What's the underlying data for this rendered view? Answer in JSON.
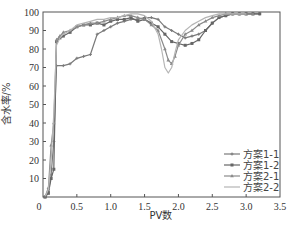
{
  "chart_data": {
    "type": "line",
    "title": "",
    "xlabel": "PV数",
    "ylabel": "含水率/%",
    "xlim": [
      0,
      3.5
    ],
    "ylim": [
      0,
      100
    ],
    "xticks": [
      "0",
      "0.5",
      "1.0",
      "1.5",
      "2.0",
      "2.5",
      "3.0",
      "3.5"
    ],
    "yticks": [
      "0",
      "10",
      "20",
      "30",
      "40",
      "50",
      "60",
      "70",
      "80",
      "90",
      "100"
    ],
    "grid": false,
    "legend_position": "lower right",
    "series": [
      {
        "name": "方案1-1",
        "color": "#7a7a7a",
        "marker": "plus",
        "x": [
          0.03,
          0.08,
          0.12,
          0.16,
          0.2,
          0.3,
          0.4,
          0.5,
          0.6,
          0.7,
          0.8,
          0.9,
          1.0,
          1.1,
          1.2,
          1.3,
          1.4,
          1.5,
          1.6,
          1.7,
          1.8,
          1.9,
          2.0,
          2.1,
          2.2,
          2.3,
          2.4,
          2.5,
          2.6,
          2.7,
          2.8,
          2.9,
          3.0,
          3.1,
          3.2
        ],
        "y": [
          0,
          3,
          12,
          30,
          71,
          71,
          72,
          75,
          76,
          77,
          88,
          90,
          92,
          94,
          95,
          96,
          96,
          97,
          97,
          96,
          92,
          90,
          88,
          86,
          87,
          88,
          90,
          94,
          97,
          98,
          99,
          99,
          99,
          99,
          99
        ]
      },
      {
        "name": "方案1-2",
        "color": "#666666",
        "marker": "square",
        "x": [
          0.03,
          0.08,
          0.12,
          0.16,
          0.2,
          0.25,
          0.3,
          0.4,
          0.5,
          0.6,
          0.7,
          0.8,
          0.9,
          1.0,
          1.1,
          1.2,
          1.3,
          1.4,
          1.5,
          1.6,
          1.7,
          1.8,
          1.9,
          2.0,
          2.1,
          2.2,
          2.3,
          2.4,
          2.5,
          2.6,
          2.7,
          2.8,
          2.9,
          3.0,
          3.1,
          3.2
        ],
        "y": [
          0,
          2,
          10,
          15,
          84,
          86,
          87,
          89,
          92,
          93,
          93,
          94,
          93,
          95,
          96,
          96,
          97,
          95,
          96,
          94,
          92,
          88,
          84,
          83,
          82,
          83,
          85,
          90,
          94,
          97,
          98,
          99,
          99,
          99,
          99,
          99
        ]
      },
      {
        "name": "方案2-1",
        "color": "#8a8a8a",
        "marker": "triangle",
        "x": [
          0.03,
          0.08,
          0.12,
          0.16,
          0.2,
          0.25,
          0.3,
          0.4,
          0.5,
          0.6,
          0.7,
          0.8,
          0.9,
          1.0,
          1.1,
          1.2,
          1.3,
          1.4,
          1.5,
          1.6,
          1.7,
          1.8,
          1.85,
          1.9,
          1.95,
          2.0,
          2.1,
          2.2,
          2.3,
          2.4,
          2.5,
          2.6,
          2.7,
          2.8,
          2.9,
          3.0,
          3.1
        ],
        "y": [
          0,
          5,
          28,
          40,
          85,
          87,
          89,
          90,
          92,
          93,
          94,
          94,
          95,
          96,
          97,
          98,
          98,
          97,
          96,
          93,
          90,
          80,
          74,
          72,
          76,
          82,
          88,
          90,
          93,
          95,
          97,
          98,
          99,
          99,
          99,
          99,
          99
        ]
      },
      {
        "name": "方案2-2",
        "color": "#b5b5b5",
        "marker": "none",
        "x": [
          0.03,
          0.08,
          0.12,
          0.16,
          0.2,
          0.25,
          0.3,
          0.4,
          0.5,
          0.6,
          0.7,
          0.8,
          0.9,
          1.0,
          1.1,
          1.2,
          1.3,
          1.4,
          1.5,
          1.6,
          1.7,
          1.75,
          1.8,
          1.85,
          1.9,
          1.95,
          2.0,
          2.1,
          2.2,
          2.3,
          2.4,
          2.5,
          2.6,
          2.7,
          2.8,
          2.9,
          3.0
        ],
        "y": [
          0,
          4,
          20,
          45,
          82,
          86,
          88,
          90,
          93,
          94,
          95,
          96,
          96,
          97,
          97,
          98,
          99,
          99,
          98,
          95,
          88,
          80,
          70,
          67,
          70,
          78,
          85,
          90,
          93,
          95,
          97,
          98,
          99,
          99,
          99,
          99,
          99
        ]
      }
    ]
  }
}
